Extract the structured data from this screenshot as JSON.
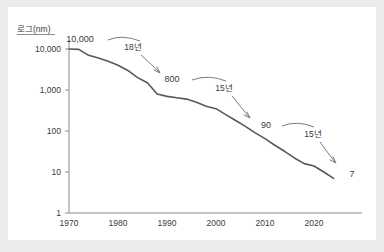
{
  "chart_data": {
    "type": "line",
    "title": "",
    "xlabel": "",
    "ylabel": "로그(nm)",
    "y_scale": "log",
    "ylim": [
      1,
      20000
    ],
    "xlim": [
      1968,
      2026
    ],
    "grid": false,
    "legend": null,
    "y_ticks": [
      "10,000",
      "1,000",
      "100",
      "10",
      "1"
    ],
    "y_tick_values": [
      10000,
      1000,
      100,
      10,
      1
    ],
    "x_ticks": [
      "1970",
      "1980",
      "1990",
      "2000",
      "2010",
      "2020"
    ],
    "x_tick_values": [
      1970,
      1980,
      1990,
      2000,
      2010,
      2020
    ],
    "x": [
      1970,
      1972,
      1974,
      1976,
      1978,
      1980,
      1982,
      1984,
      1986,
      1988,
      1990,
      1992,
      1994,
      1996,
      1998,
      2000,
      2002,
      2004,
      2006,
      2008,
      2010,
      2012,
      2014,
      2016,
      2018,
      2020,
      2022,
      2024
    ],
    "values": [
      10000,
      9800,
      7000,
      6000,
      5000,
      4000,
      3000,
      2000,
      1500,
      800,
      700,
      650,
      600,
      500,
      400,
      350,
      250,
      180,
      130,
      90,
      65,
      45,
      32,
      22,
      16,
      14,
      10,
      7
    ],
    "annotations": [
      {
        "label": "10,000",
        "kind": "point-value",
        "x": 1970,
        "y": 10000
      },
      {
        "label": "800",
        "kind": "point-value",
        "x": 1988,
        "y": 800
      },
      {
        "label": "90",
        "kind": "point-value",
        "x": 2008,
        "y": 90
      },
      {
        "label": "7",
        "kind": "point-value",
        "x": 2024,
        "y": 7
      },
      {
        "label": "18년",
        "kind": "span",
        "from": 1970,
        "to": 1988,
        "years": 18
      },
      {
        "label": "15년",
        "kind": "span",
        "from": 1988,
        "to": 2008,
        "years": 15
      },
      {
        "label": "15년",
        "kind": "span",
        "from": 2008,
        "to": 2024,
        "years": 15
      }
    ]
  },
  "axis": {
    "y_title": "로그(nm)",
    "y_tick_10000": "10,000",
    "y_tick_1000": "1,000",
    "y_tick_100": "100",
    "y_tick_10": "10",
    "y_tick_1": "1",
    "x_tick_1970": "1970",
    "x_tick_1980": "1980",
    "x_tick_1990": "1990",
    "x_tick_2000": "2000",
    "x_tick_2010": "2010",
    "x_tick_2020": "2020"
  },
  "labels": {
    "start_value": "10,000",
    "value_800": "800",
    "value_90": "90",
    "end_value": "7",
    "span_1": "18년",
    "span_2": "15년",
    "span_3": "15년"
  },
  "colors": {
    "page_background": "#ececed",
    "card_background": "#ffffff",
    "line": "#58585a",
    "axis": "#8d8d8f",
    "text": "#3a3a3c",
    "annotation": "#6e6e70"
  }
}
